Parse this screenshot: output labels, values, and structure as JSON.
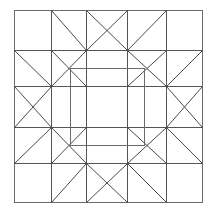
{
  "figure": {
    "title": "Quilt Block Pattern",
    "kind": "line-drawing",
    "background_color": "#ffffff",
    "line_color": "#555555",
    "frame_color": "#6b6b6b",
    "diagonal_color": "#4a4a4a",
    "line_width": 1,
    "width": 215,
    "height": 214
  },
  "geometry": {
    "outer_square": {
      "x": 14,
      "y": 10,
      "width": 189,
      "height": 193
    },
    "grid_x": [
      14,
      51,
      86,
      127,
      166,
      203
    ],
    "grid_y": [
      10,
      50,
      86,
      127,
      163,
      203
    ],
    "inner_square": {
      "x": 70,
      "y": 68,
      "width": 74,
      "height": 77
    },
    "column_labels": [
      "corner",
      "star-point-left",
      "center-left",
      "center-right",
      "star-point-right"
    ],
    "row_labels": [
      "corner",
      "star-point-top",
      "center-top",
      "center-bottom",
      "star-point-bottom"
    ]
  },
  "regions": {
    "corner_top_left": "plain-square",
    "corner_top_right": "plain-square",
    "corner_bottom_left": "plain-square",
    "corner_bottom_right": "plain-square",
    "top_band": "half-square-triangle-row",
    "bottom_band": "half-square-triangle-row",
    "left_band": "half-square-triangle-column",
    "right_band": "half-square-triangle-column",
    "center": "open-square"
  },
  "labels": {
    "center_patch": "",
    "caption": ""
  }
}
